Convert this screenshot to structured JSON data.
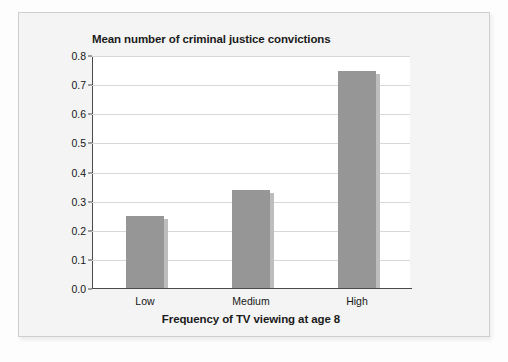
{
  "figure": {
    "title": "Mean number of criminal justice convictions",
    "xaxis_title": "Frequency of TV viewing at age 8"
  },
  "chart_data": {
    "type": "bar",
    "title": "Mean number of criminal justice convictions",
    "xlabel": "Frequency of TV viewing at age 8",
    "ylabel": "",
    "categories": [
      "Low",
      "Medium",
      "High"
    ],
    "values": [
      0.25,
      0.34,
      0.75
    ],
    "ylim": [
      0.0,
      0.8
    ],
    "ytick_labels": [
      "0.0",
      "0.1",
      "0.2",
      "0.3",
      "0.4",
      "0.5",
      "0.6",
      "0.7",
      "0.8"
    ],
    "ytick_values": [
      0.0,
      0.1,
      0.2,
      0.3,
      0.4,
      0.5,
      0.6,
      0.7,
      0.8
    ],
    "grid": true,
    "legend": false,
    "bar_color": "#969696",
    "plot_background": "#ffffff",
    "axis_color": "#4a4a4a",
    "gridline_color": "#d8d8d8"
  }
}
